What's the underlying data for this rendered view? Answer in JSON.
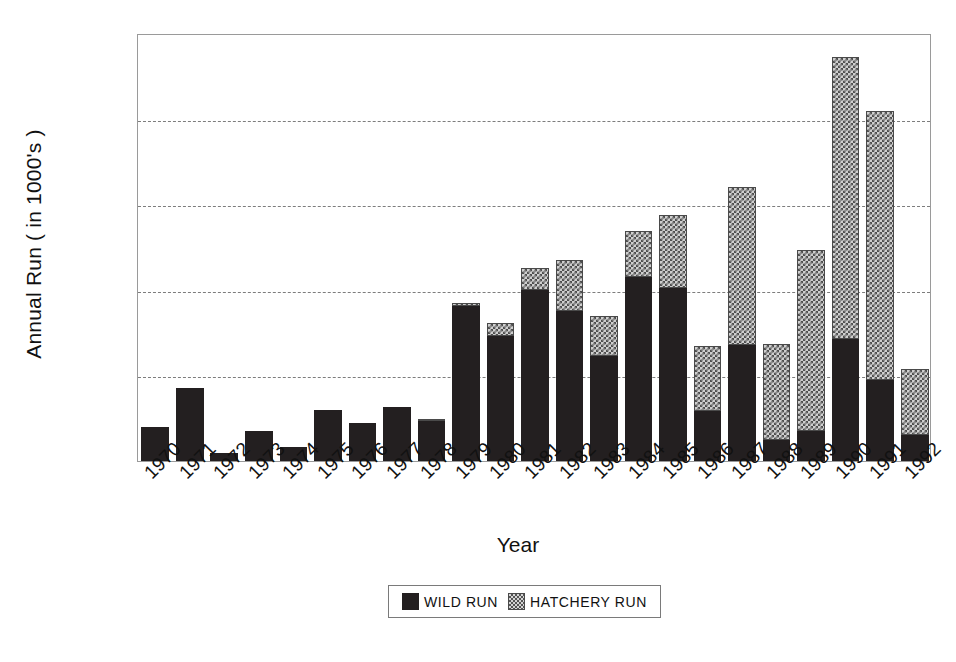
{
  "chart_data": {
    "type": "bar",
    "subtype": "stacked-vertical",
    "title": "",
    "xlabel": "Year",
    "ylabel": "Annual Run ( in 1000's )",
    "ylim": [
      0,
      50000
    ],
    "ytick_labels": [
      "0",
      "10,000",
      "20,000",
      "30,000",
      "40,000",
      "50,000"
    ],
    "ytick_values": [
      0,
      10000,
      20000,
      30000,
      40000,
      50000
    ],
    "grid": "horizontal-dashed",
    "legend_position": "below-axes-center",
    "categories": [
      "1970",
      "1971",
      "1972",
      "1973",
      "1974",
      "1975",
      "1976",
      "1977",
      "1978",
      "1979",
      "1980",
      "1981",
      "1982",
      "1983",
      "1984",
      "1985",
      "1986",
      "1987",
      "1988",
      "1989",
      "1990",
      "1991",
      "1992"
    ],
    "series": [
      {
        "name": "WILD RUN",
        "color": "#231f20",
        "pattern": "solid",
        "values": [
          4000,
          8500,
          900,
          3500,
          1600,
          6000,
          4400,
          6300,
          4700,
          18100,
          14600,
          20000,
          17500,
          12300,
          21500,
          20200,
          5900,
          13500,
          2400,
          3500,
          14200,
          9500,
          3000
        ]
      },
      {
        "name": "HATCHERY RUN",
        "color": "#cfcfcf",
        "pattern": "checkered",
        "values": [
          0,
          0,
          0,
          0,
          0,
          0,
          0,
          0,
          100,
          350,
          1500,
          2500,
          6000,
          4700,
          5400,
          8500,
          7500,
          18500,
          11300,
          21200,
          33000,
          31400,
          7700
        ]
      }
    ],
    "totals": [
      4000,
      8500,
      900,
      3500,
      1600,
      6000,
      4400,
      6300,
      4800,
      18450,
      16100,
      22500,
      23500,
      17000,
      26900,
      28700,
      13400,
      32000,
      13700,
      24700,
      47200,
      40900,
      10700
    ]
  },
  "legend": {
    "entries": [
      {
        "label": "WILD RUN",
        "swatch": "solid-black-swatch"
      },
      {
        "label": "HATCHERY RUN",
        "swatch": "checkered-gray-swatch"
      }
    ]
  }
}
